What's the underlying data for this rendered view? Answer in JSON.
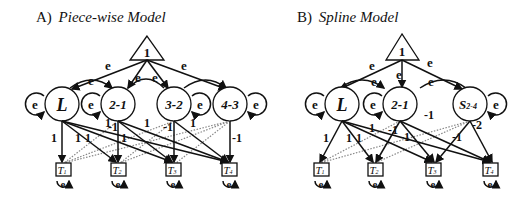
{
  "panels": {
    "a": {
      "prefix": "A)",
      "title": "Piece-wise Model",
      "constant": "1",
      "error_label": "e",
      "latents": [
        "L",
        "2-1",
        "3-2",
        "4-3"
      ],
      "observed": [
        "T1",
        "T2",
        "T3",
        "T4"
      ],
      "observed_main": "T",
      "observed_subs": [
        "1",
        "2",
        "3",
        "4"
      ],
      "loadings": {
        "l_t1": "1",
        "l_t2": "1",
        "l_t3": "1",
        "l_t4": "1",
        "d21_t2": "1",
        "d21_t1": "-1",
        "d21_t3": "1",
        "d32_t3": "1",
        "d32_t2": "-1",
        "d32_t4": "1",
        "d43_t4": "-1",
        "misc": "1"
      }
    },
    "b": {
      "prefix": "B)",
      "title": "Spline  Model",
      "constant": "1",
      "error_label": "e",
      "latents": [
        "L",
        "2-1"
      ],
      "spline_main": "S",
      "spline_sub": "2-4",
      "observed_main": "T",
      "observed_subs": [
        "1",
        "2",
        "3",
        "4"
      ],
      "loadings": {
        "l_t1": "1",
        "l_t2": "1",
        "l_t3": "1",
        "d21_a": "1",
        "d21_b": "-1",
        "d21_c": "-1",
        "s_a": "-1",
        "s_b": "-1",
        "s_c": "-2"
      }
    }
  }
}
